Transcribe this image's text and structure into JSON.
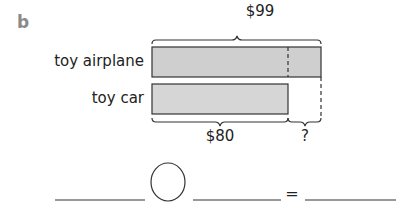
{
  "part_label": "b",
  "bar_model": {
    "rows": [
      {
        "label": "toy airplane",
        "value": 99
      },
      {
        "label": "toy car",
        "value": 80
      }
    ],
    "top_brace_label": "$99",
    "bottom_brace_left_label": "$80",
    "bottom_brace_right_label": "?",
    "bar_fill": "#cfcfcf",
    "bar_stroke": "#333333"
  },
  "equation": {
    "operator_placeholder": "",
    "equals_sign": "="
  }
}
